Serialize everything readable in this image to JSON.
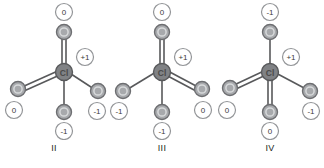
{
  "figure": {
    "background_color": "#ffffff",
    "colors": {
      "bond": "#58595b",
      "atom_ring": "#808285",
      "atom_fill": "#a7a9ac",
      "atom_inner_ring": "#d1d3d4",
      "charge_ring": "#939598",
      "charge_fill": "#ffffff",
      "label_text": "#231f20"
    },
    "central_atom_label": "Cl",
    "central_charge": "+1",
    "oxygen_label": "O"
  },
  "structures": [
    {
      "label": "II",
      "center": {
        "symbol": "Cl",
        "charge": "+1"
      },
      "atoms": [
        {
          "position": "top",
          "symbol": "O",
          "charge": "0",
          "bond": "double"
        },
        {
          "position": "left",
          "symbol": "O",
          "charge": "0",
          "bond": "double"
        },
        {
          "position": "right",
          "symbol": "O",
          "charge": "-1",
          "bond": "single"
        },
        {
          "position": "bottom",
          "symbol": "O",
          "charge": "-1",
          "bond": "single"
        }
      ]
    },
    {
      "label": "III",
      "center": {
        "symbol": "Cl",
        "charge": "+1"
      },
      "atoms": [
        {
          "position": "top",
          "symbol": "O",
          "charge": "0",
          "bond": "double"
        },
        {
          "position": "left",
          "symbol": "O",
          "charge": "-1",
          "bond": "single"
        },
        {
          "position": "right",
          "symbol": "O",
          "charge": "0",
          "bond": "double"
        },
        {
          "position": "bottom",
          "symbol": "O",
          "charge": "-1",
          "bond": "single"
        }
      ]
    },
    {
      "label": "IV",
      "center": {
        "symbol": "Cl",
        "charge": "+1"
      },
      "atoms": [
        {
          "position": "top",
          "symbol": "O",
          "charge": "-1",
          "bond": "single"
        },
        {
          "position": "left",
          "symbol": "O",
          "charge": "0",
          "bond": "double"
        },
        {
          "position": "right",
          "symbol": "O",
          "charge": "-1",
          "bond": "single"
        },
        {
          "position": "bottom",
          "symbol": "O",
          "charge": "0",
          "bond": "double"
        }
      ]
    }
  ]
}
